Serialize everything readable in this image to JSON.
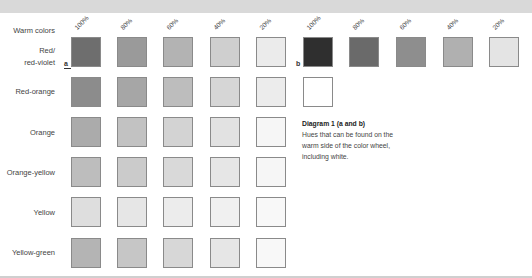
{
  "header_label": "Warm colors",
  "columns_a": [
    "100%",
    "80%",
    "60%",
    "40%",
    "20%"
  ],
  "columns_b": [
    "100%",
    "80%",
    "60%",
    "40%",
    "20%"
  ],
  "markers": {
    "a": "a",
    "b": "b"
  },
  "rows": [
    {
      "label_line1": "Red/",
      "label_line2": "red-violet",
      "swatches_a": [
        "#6e6e6e",
        "#9a9a9a",
        "#b3b3b3",
        "#cfcfcf",
        "#ebebeb"
      ],
      "swatches_b": [
        "#2f2f2f",
        "#6a6a6a",
        "#8e8e8e",
        "#b0b0b0",
        "#e4e4e4"
      ]
    },
    {
      "label_line1": "Red-orange",
      "swatches_a": [
        "#8c8c8c",
        "#a6a6a6",
        "#bdbdbd",
        "#d6d6d6",
        "#ececec"
      ],
      "swatches_b": [
        "#ffffff"
      ]
    },
    {
      "label_line1": "Orange",
      "swatches_a": [
        "#ababab",
        "#c2c2c2",
        "#d3d3d3",
        "#e2e2e2",
        "#f6f6f6"
      ]
    },
    {
      "label_line1": "Orange-yellow",
      "swatches_a": [
        "#bdbdbd",
        "#cbcbcb",
        "#d9d9d9",
        "#e6e6e6",
        "#f6f6f6"
      ]
    },
    {
      "label_line1": "Yellow",
      "swatches_a": [
        "#dedede",
        "#e6e6e6",
        "#ececec",
        "#f0f0f0",
        "#f8f8f8"
      ]
    },
    {
      "label_line1": "Yellow-green",
      "swatches_a": [
        "#b4b4b4",
        "#c6c6c6",
        "#d7d7d7",
        "#e6e6e6",
        "#f8f8f8"
      ]
    }
  ],
  "caption": {
    "title": "Diagram 1 (a and b)",
    "line1": "Hues that can be found on the",
    "line2": "warm side of the color wheel,",
    "line3": "including white."
  }
}
